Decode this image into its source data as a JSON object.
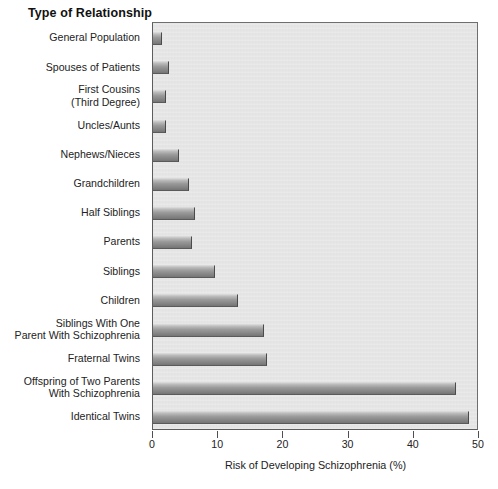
{
  "chart_data": {
    "type": "bar",
    "orientation": "horizontal",
    "title": "Type of Relationship",
    "xlabel": "Risk of Developing Schizophrenia (%)",
    "ylabel": "Type of Relationship",
    "xlim": [
      0,
      50
    ],
    "xticks": [
      0,
      10,
      20,
      30,
      40,
      50
    ],
    "xtick_labels": [
      "0",
      "10",
      "20",
      "30",
      "40",
      "50"
    ],
    "grid": false,
    "legend": null,
    "plot_background": "#e6e6e6",
    "bar_color": "#8d8d8d",
    "categories": [
      "General Population",
      "Spouses of Patients",
      "First Cousins\n(Third Degree)",
      "Uncles/Aunts",
      "Nephews/Nieces",
      "Grandchildren",
      "Half Siblings",
      "Parents",
      "Siblings",
      "Children",
      "Siblings With One\nParent With Schizophrenia",
      "Fraternal Twins",
      "Offspring of Two Parents\nWith Schizophrenia",
      "Identical Twins"
    ],
    "values": [
      1.4,
      2.5,
      2,
      2,
      4,
      5.5,
      6.5,
      6,
      9.5,
      13,
      17,
      17.5,
      46.5,
      48.5
    ],
    "bars": [
      {
        "label": "General Population",
        "value": 1.4
      },
      {
        "label": "Spouses of Patients",
        "value": 2.5
      },
      {
        "label": "First Cousins (Third Degree)",
        "value": 2
      },
      {
        "label": "Uncles/Aunts",
        "value": 2
      },
      {
        "label": "Nephews/Nieces",
        "value": 4
      },
      {
        "label": "Grandchildren",
        "value": 5.5
      },
      {
        "label": "Half Siblings",
        "value": 6.5
      },
      {
        "label": "Parents",
        "value": 6
      },
      {
        "label": "Siblings",
        "value": 9.5
      },
      {
        "label": "Children",
        "value": 13
      },
      {
        "label": "Siblings With One Parent With Schizophrenia",
        "value": 17
      },
      {
        "label": "Fraternal Twins",
        "value": 17.5
      },
      {
        "label": "Offspring of Two Parents With Schizophrenia",
        "value": 46.5
      },
      {
        "label": "Identical Twins",
        "value": 48.5
      }
    ]
  }
}
